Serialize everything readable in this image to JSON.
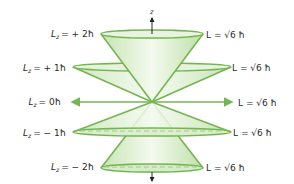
{
  "diagram": {
    "axis_label": "z",
    "colors": {
      "cone_stroke": "#74b552",
      "cone_fill_light": "#f1f8ec",
      "cone_fill_dark": "#c7e4b4",
      "rim_fill": "#e3f1d9",
      "dashed": "#9ac982",
      "axis": "#222222",
      "text": "#2a2a2a"
    },
    "levels": [
      {
        "lz_left": "L",
        "lz_sub": "z",
        "lz_value": "= + 2ħ",
        "l_right": "L = √6 ħ"
      },
      {
        "lz_left": "L",
        "lz_sub": "z",
        "lz_value": "= + 1ħ",
        "l_right": "L = √6 ħ"
      },
      {
        "lz_left": "L",
        "lz_sub": "z",
        "lz_value": "= 0ħ",
        "l_right": "L = √6 ħ"
      },
      {
        "lz_left": "L",
        "lz_sub": "z",
        "lz_value": "= − 1ħ",
        "l_right": "L = √6 ħ"
      },
      {
        "lz_left": "L",
        "lz_sub": "z",
        "lz_value": "= − 2ħ",
        "l_right": "L = √6 ħ"
      }
    ]
  }
}
